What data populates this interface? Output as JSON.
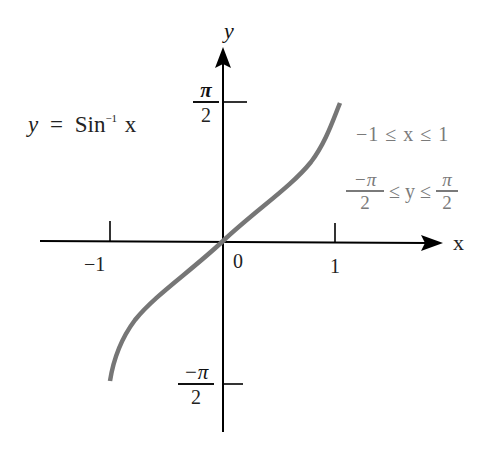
{
  "title": {
    "lhs": "y",
    "eq": "=",
    "fn": "Sin",
    "sup": "−1",
    "arg": "x"
  },
  "axes": {
    "x_label": "x",
    "y_label": "y",
    "x_ticks": [
      {
        "label": "−1",
        "value": -1
      },
      {
        "label": "1",
        "value": 1
      }
    ],
    "origin_label": "0",
    "y_ticks": [
      {
        "num": "π",
        "den": "2",
        "value": "π/2"
      },
      {
        "num": "−π",
        "den": "2",
        "value": "−π/2"
      }
    ]
  },
  "domain_text": {
    "line": "−1 ≤ x ≤ 1"
  },
  "range_text": {
    "lower_num": "−π",
    "lower_den": "2",
    "middle": "≤ y ≤",
    "upper_num": "π",
    "upper_den": "2"
  },
  "colors": {
    "axis": "#000000",
    "curve": "#767676",
    "annotation": "#7a7a7a",
    "text": "#222222"
  }
}
